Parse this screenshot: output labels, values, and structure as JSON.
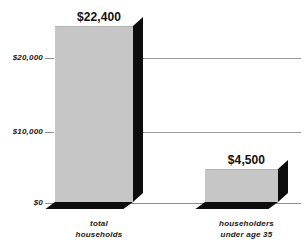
{
  "chart_data": {
    "type": "bar",
    "title": "",
    "subtitle": "",
    "xlabel": "",
    "ylabel": "",
    "categories": [
      "total households",
      "householders under age 35"
    ],
    "values": [
      22400,
      4500
    ],
    "data_labels": [
      "$22,400",
      "$4,500"
    ],
    "ylim": [
      0,
      25000
    ],
    "yticks": [
      0,
      10000,
      20000
    ],
    "ytick_labels": [
      "$0",
      "$10,000",
      "$20,000"
    ],
    "grid": true,
    "legend": null,
    "style": "3d-block-bars",
    "colors": {
      "bar_face": "#c6c6c6",
      "bar_shadow": "#0d0d0d",
      "gridline": "#9a9a9a",
      "text": "#1a1a1a",
      "background": "#ffffff"
    }
  },
  "axis": {
    "y_ticks": [
      {
        "label": "$20,000",
        "value": 20000
      },
      {
        "label": "$10,000",
        "value": 10000
      },
      {
        "label": "$0",
        "value": 0
      }
    ]
  },
  "bars": [
    {
      "value_label": "$22,400",
      "category_line1": "total",
      "category_line2": "households"
    },
    {
      "value_label": "$4,500",
      "category_line1": "householders",
      "category_line2": "under age 35"
    }
  ]
}
